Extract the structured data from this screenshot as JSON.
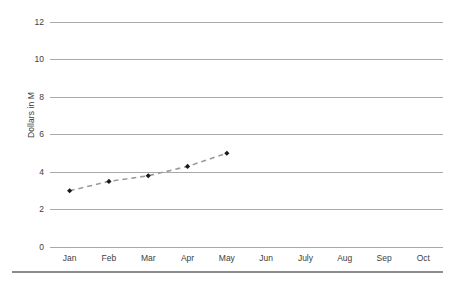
{
  "chart_data": {
    "type": "line",
    "title": "",
    "subtitle": "",
    "xlabel": "",
    "ylabel": "Dollars in M",
    "categories": [
      "Jan",
      "Feb",
      "Mar",
      "Apr",
      "May",
      "Jun",
      "July",
      "Aug",
      "Sep",
      "Oct"
    ],
    "series": [
      {
        "name": "Dollars in M",
        "values": [
          3.0,
          3.5,
          3.8,
          4.3,
          5.0,
          null,
          null,
          null,
          null,
          null
        ],
        "line_style": "dashed",
        "line_color": "#9a9a9a",
        "marker": "diamond",
        "marker_color": "#1a1a1a"
      }
    ],
    "ylim": [
      0,
      12
    ],
    "y_ticks": [
      0,
      2,
      4,
      6,
      8,
      10,
      12
    ],
    "y_tick_labels": [
      "0",
      "2",
      "4",
      "6",
      "8",
      "10",
      "12"
    ],
    "grid": true,
    "grid_axis": "y",
    "grid_color": "#a9a9a9",
    "legend": false,
    "legend_position": "none",
    "background_color": "#ffffff",
    "axis_text_color": "#404040",
    "footer_rule_color": "#8c8c8c"
  }
}
